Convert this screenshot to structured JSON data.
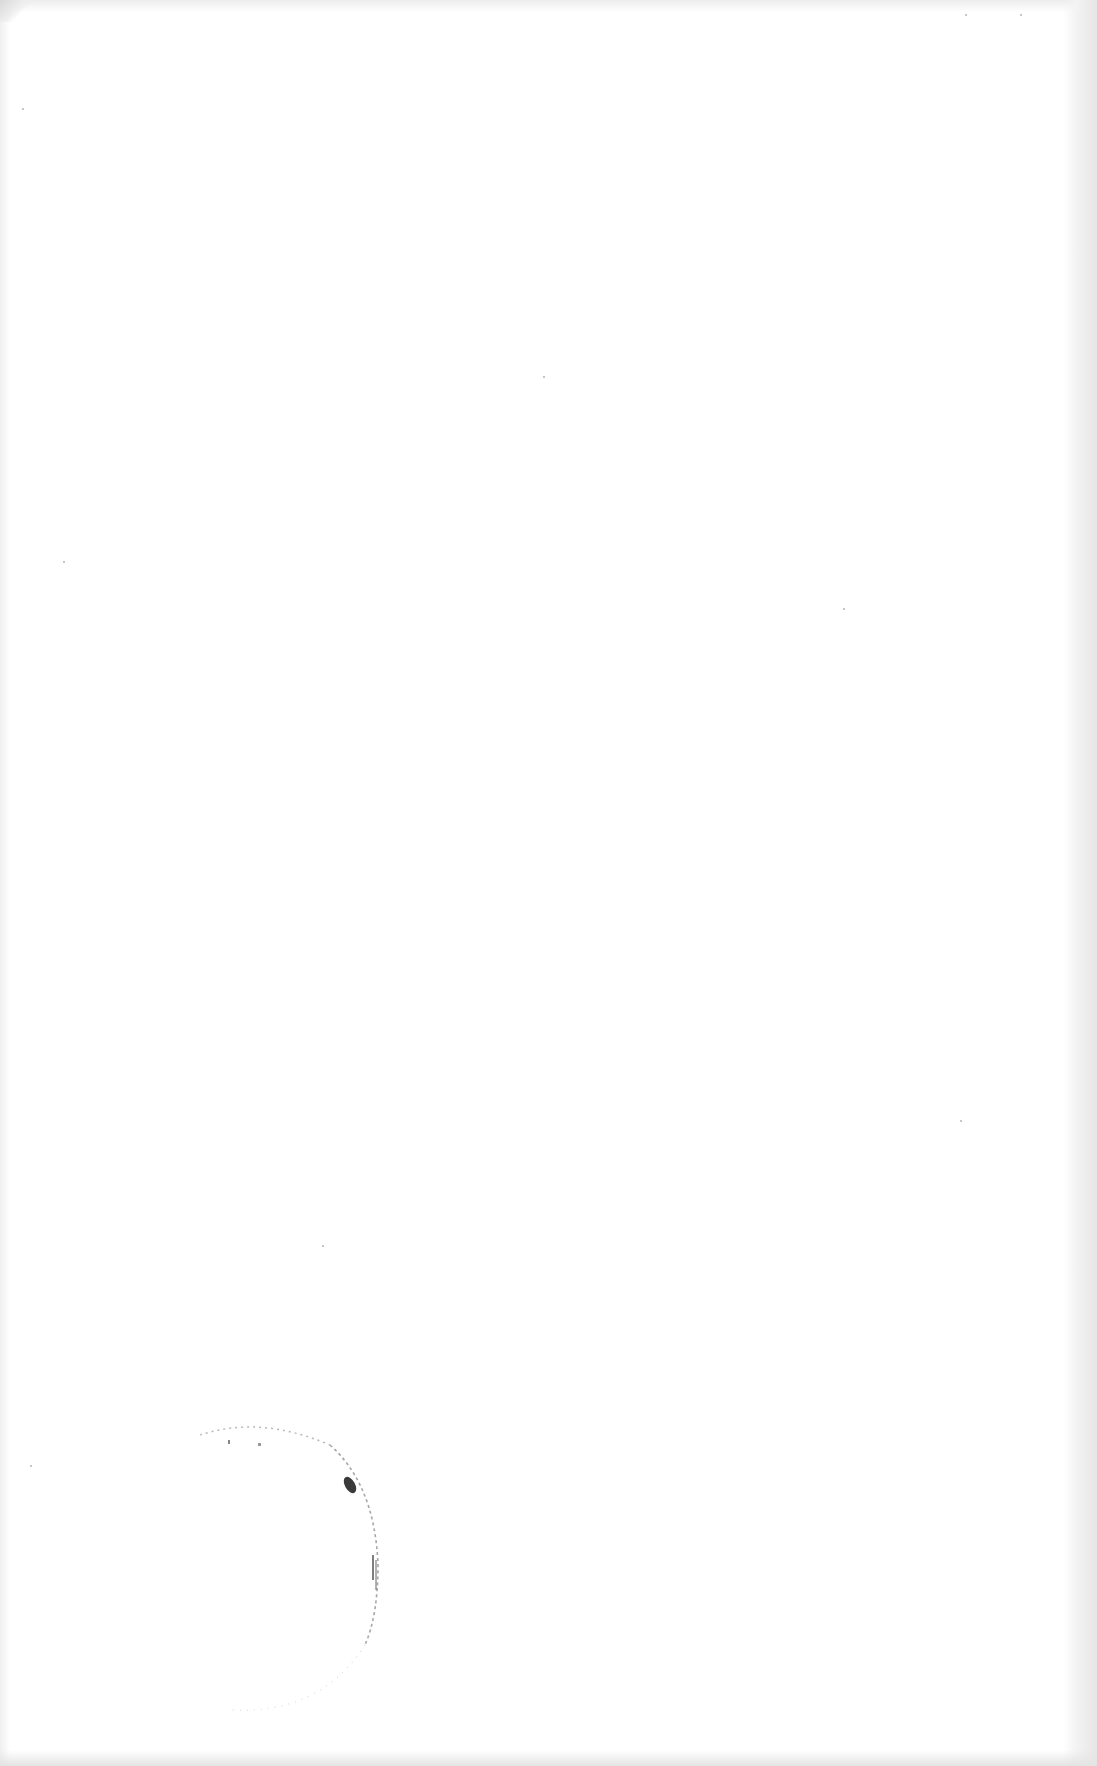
{
  "document": {
    "type": "blank scanned page",
    "text_content": []
  },
  "stamp": {
    "shape": "partial circle",
    "legible_text": null
  },
  "colors": {
    "paper": "#ffffff",
    "scan_edge": "#e6e6e6",
    "stamp_ink": "#3a3a3a"
  }
}
